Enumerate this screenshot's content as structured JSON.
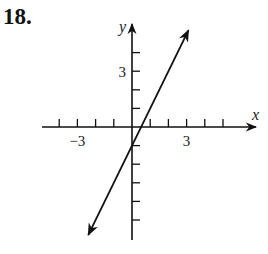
{
  "problem": {
    "number": "18."
  },
  "chart_data": {
    "type": "line",
    "title": "",
    "xlabel": "x",
    "ylabel": "y",
    "x_tick_labels": [
      {
        "value": -3,
        "label": "−3"
      },
      {
        "value": 3,
        "label": "3"
      }
    ],
    "y_tick_labels": [
      {
        "value": 3,
        "label": "3"
      }
    ],
    "x_ticks": [
      -4,
      -3,
      -2,
      -1,
      1,
      2,
      3,
      4,
      5
    ],
    "y_ticks": [
      -5,
      -4,
      -3,
      -2,
      -1,
      1,
      2,
      3,
      4
    ],
    "xlim": [
      -5,
      7
    ],
    "ylim": [
      -6,
      6
    ],
    "grid": false,
    "legend": null,
    "series": [
      {
        "name": "line",
        "equation": "y = 2x - 1",
        "slope": 2,
        "y_intercept": -1,
        "x_intercept": 0.5,
        "arrows_both_ends": true,
        "points": [
          {
            "x": -2.4,
            "y": -5.8
          },
          {
            "x": 0,
            "y": -1
          },
          {
            "x": 0.5,
            "y": 0
          },
          {
            "x": 3.1,
            "y": 5.2
          }
        ]
      }
    ]
  },
  "layout": {
    "origin_px": [
      132,
      127
    ],
    "unit_x_px": 18.2,
    "unit_y_px": 18.6,
    "x_axis_px": [
      42,
      256
    ],
    "y_axis_px": [
      240,
      24
    ],
    "colors": {
      "ink": "#111111",
      "background": "#ffffff"
    }
  }
}
